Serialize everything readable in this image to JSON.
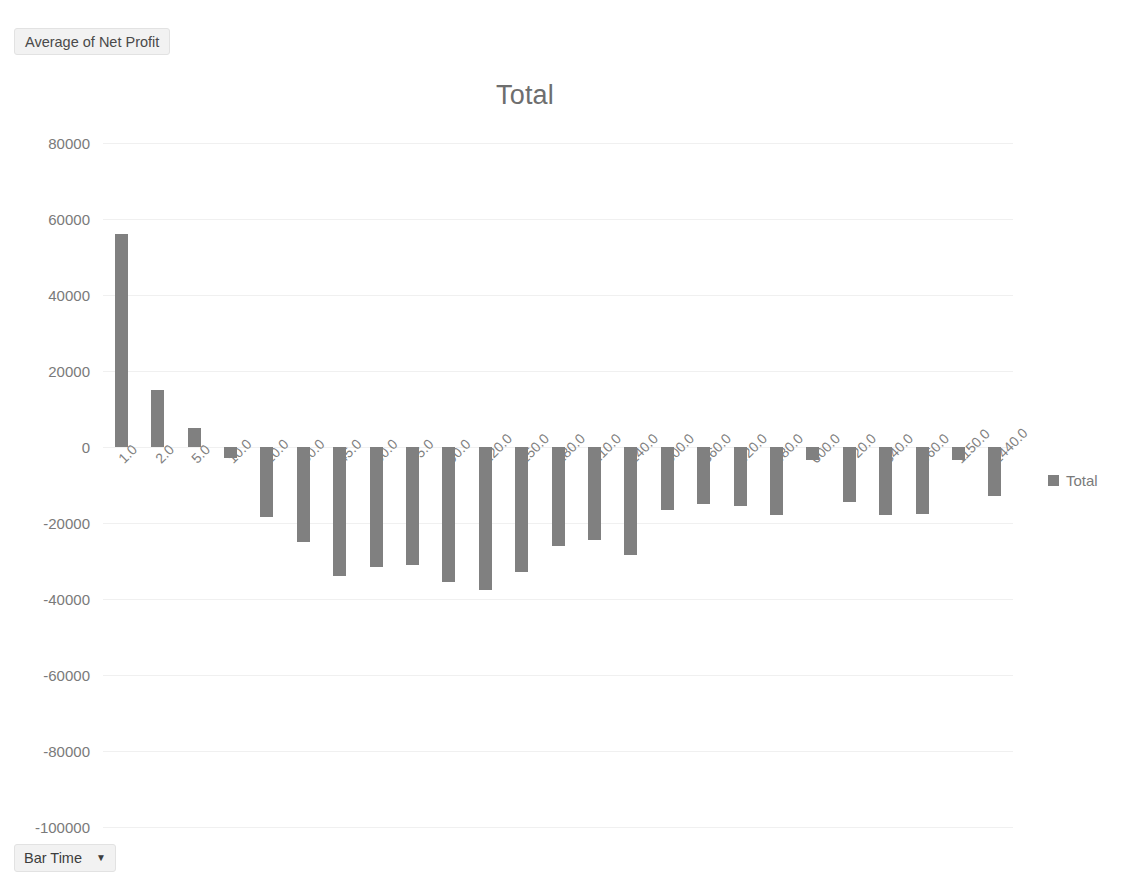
{
  "field_button": {
    "label": "Average of Net Profit"
  },
  "axis_button": {
    "label": "Bar Time",
    "caret": "▼"
  },
  "legend": {
    "entries": [
      {
        "label": "Total",
        "color": "#808080"
      }
    ]
  },
  "chart_data": {
    "type": "bar",
    "title": "Total",
    "xlabel": "",
    "ylabel": "",
    "ylim": [
      -100000,
      80000
    ],
    "ytick_labels": [
      "80000",
      "60000",
      "40000",
      "20000",
      "0",
      "-20000",
      "-40000",
      "-60000",
      "-80000",
      "-100000"
    ],
    "ytick_values": [
      80000,
      60000,
      40000,
      20000,
      0,
      -20000,
      -40000,
      -60000,
      -80000,
      -100000
    ],
    "grid": true,
    "legend_position": "right",
    "bar_color": "#808080",
    "series_name": "Total",
    "categories": [
      "1.0",
      "2.0",
      "5.0",
      "10.0",
      "20.0",
      "30.0",
      "45.0",
      "60.0",
      "75.0",
      "90.0",
      "120.0",
      "150.0",
      "180.0",
      "210.0",
      "240.0",
      "300.0",
      "360.0",
      "420.0",
      "480.0",
      "600.0",
      "720.0",
      "840.0",
      "960.0",
      "1150.0",
      "1440.0"
    ],
    "values": [
      56000,
      15000,
      5000,
      -3000,
      -18500,
      -25000,
      -34000,
      -31500,
      -31000,
      -35500,
      -37500,
      -33000,
      -26000,
      -24500,
      -28500,
      -16500,
      -15000,
      -15500,
      -18000,
      -3500,
      -14500,
      -18000,
      -17500,
      -3500,
      -13000
    ]
  }
}
